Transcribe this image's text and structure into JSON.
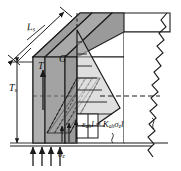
{
  "figure": {
    "type": "engineering-diagram",
    "background": "#ffffff",
    "line_color": "#1a1a1a",
    "fill_front_panel": "#a9a9a9",
    "fill_side_panel": "#b4b4b4",
    "fill_top_panel": "#9e9e9e",
    "fill_wedge": "#bdbdbd"
  },
  "labels": {
    "length": {
      "base": "L",
      "sub": "s",
      "text": "Ls"
    },
    "thickness": {
      "base": "T",
      "sub": "s",
      "text": "Ts"
    },
    "tension": {
      "base": "T",
      "sub": "",
      "text": "T"
    },
    "shear_modulus": {
      "base": "G",
      "sub": "",
      "text": "G"
    },
    "stress_vertical": {
      "base": "σ",
      "sub": "z",
      "text": "σz"
    }
  },
  "equation": {
    "lhs_sym": "ε",
    "lhs_sub": "ah",
    "lhs_tail": "l",
    "equals": "=",
    "rhs_sym": "K",
    "rhs_sub": "ah",
    "rhs_sigma": "σ",
    "rhs_sigma_sub": "z",
    "rhs_tail": "l",
    "full_text": "εah l = Kah σz l"
  },
  "annotations": {
    "bottom_arrow_count": 4,
    "inner_arrow_count": 3,
    "tension_arrow_direction": "up",
    "torn_edge_side": "right",
    "dashed_line": "horizontal-centerline"
  }
}
